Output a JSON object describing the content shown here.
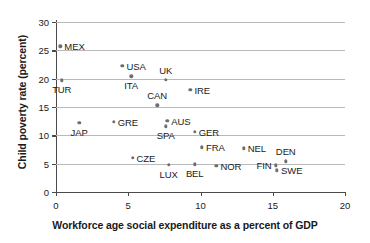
{
  "chart_data": {
    "type": "scatter",
    "title": "",
    "xlabel": "Workforce age social expenditure as a percent of GDP",
    "ylabel": "Child poverty rate (percent)",
    "xlim": [
      0,
      20
    ],
    "ylim": [
      0,
      30
    ],
    "xticks": [
      "0",
      "5",
      "10",
      "15",
      "20"
    ],
    "yticks": [
      "0",
      "5",
      "10",
      "15",
      "20",
      "25",
      "30"
    ],
    "xtick_values": [
      0,
      5,
      10,
      15,
      20
    ],
    "ytick_values": [
      0,
      5,
      10,
      15,
      20,
      25,
      30
    ],
    "grid": "horizontal",
    "legend": "none",
    "marker_color": "#6e6e6e",
    "grid_color": "#b9b9b9",
    "axis_color": "#4a4a4a",
    "points": [
      {
        "label": "MEX",
        "x": 0.3,
        "y": 25.7,
        "pos": "right"
      },
      {
        "label": "TUR",
        "x": 0.4,
        "y": 19.7,
        "pos": "below"
      },
      {
        "label": "USA",
        "x": 4.6,
        "y": 22.3,
        "pos": "right"
      },
      {
        "label": "ITA",
        "x": 5.2,
        "y": 20.4,
        "pos": "below"
      },
      {
        "label": "UK",
        "x": 7.6,
        "y": 19.8,
        "pos": "above"
      },
      {
        "label": "IRE",
        "x": 9.3,
        "y": 18.0,
        "pos": "right"
      },
      {
        "label": "CAN",
        "x": 7.0,
        "y": 15.3,
        "pos": "above"
      },
      {
        "label": "AUS",
        "x": 7.7,
        "y": 12.6,
        "pos": "right"
      },
      {
        "label": "JAP",
        "x": 1.6,
        "y": 12.2,
        "pos": "below"
      },
      {
        "label": "GRE",
        "x": 4.0,
        "y": 12.4,
        "pos": "right"
      },
      {
        "label": "SPA",
        "x": 7.6,
        "y": 11.6,
        "pos": "below"
      },
      {
        "label": "GER",
        "x": 9.6,
        "y": 10.6,
        "pos": "right"
      },
      {
        "label": "CZE",
        "x": 5.3,
        "y": 6.0,
        "pos": "right"
      },
      {
        "label": "FRA",
        "x": 10.1,
        "y": 7.9,
        "pos": "right"
      },
      {
        "label": "NEL",
        "x": 13.0,
        "y": 7.7,
        "pos": "right"
      },
      {
        "label": "DEN",
        "x": 15.9,
        "y": 5.4,
        "pos": "above"
      },
      {
        "label": "LUX",
        "x": 7.8,
        "y": 4.8,
        "pos": "below"
      },
      {
        "label": "BEL",
        "x": 9.6,
        "y": 4.9,
        "pos": "below"
      },
      {
        "label": "NOR",
        "x": 11.1,
        "y": 4.6,
        "pos": "right"
      },
      {
        "label": "FIN",
        "x": 15.2,
        "y": 4.7,
        "pos": "left"
      },
      {
        "label": "SWE",
        "x": 15.3,
        "y": 3.8,
        "pos": "right"
      }
    ]
  }
}
